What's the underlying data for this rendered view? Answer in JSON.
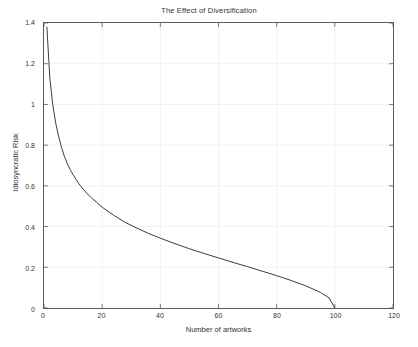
{
  "chart_data": {
    "type": "line",
    "title": "The Effect of Diversification",
    "xlabel": "Number of artworks",
    "ylabel": "Idiosyncratic Risk",
    "xlim": [
      0,
      120
    ],
    "ylim": [
      0,
      1.4
    ],
    "xticks": [
      0,
      20,
      40,
      60,
      80,
      100,
      120
    ],
    "xtick_labels": [
      "0",
      "20",
      "40",
      "60",
      "80",
      "100",
      "120"
    ],
    "yticks": [
      0,
      0.2,
      0.4,
      0.6,
      0.8,
      1,
      1.2,
      1.4
    ],
    "ytick_labels": [
      "0",
      "0.2",
      "0.4",
      "0.6",
      "0.8",
      "1",
      "1.2",
      "1.4"
    ],
    "grid": true,
    "legend": "none",
    "line_color": "#3a3a3a",
    "line_width": 1.0,
    "series": [
      {
        "name": "Idiosyncratic Risk",
        "x": [
          1,
          2,
          3,
          4,
          5,
          6,
          7,
          8,
          9,
          10,
          12,
          14,
          16,
          18,
          20,
          24,
          28,
          32,
          36,
          40,
          45,
          50,
          55,
          60,
          65,
          70,
          75,
          80,
          85,
          90,
          95,
          98,
          100
        ],
        "y": [
          1.38,
          1.13,
          1.0,
          0.91,
          0.845,
          0.79,
          0.745,
          0.71,
          0.68,
          0.655,
          0.61,
          0.575,
          0.545,
          0.52,
          0.495,
          0.455,
          0.42,
          0.392,
          0.366,
          0.343,
          0.316,
          0.291,
          0.268,
          0.246,
          0.224,
          0.203,
          0.181,
          0.159,
          0.135,
          0.109,
          0.077,
          0.05,
          0.0
        ]
      }
    ]
  },
  "figure": {
    "background": "#ffffff",
    "axes_color": "#5a5a5a",
    "grid_color": "#ededed"
  }
}
